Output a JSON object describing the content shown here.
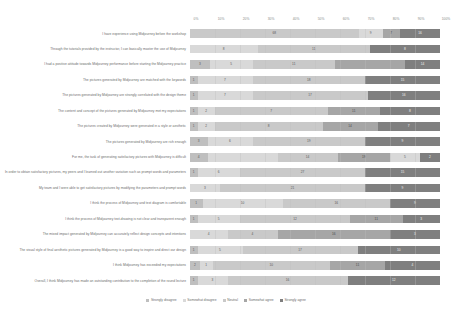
{
  "chart_data": {
    "type": "bar",
    "subtype": "100% stacked horizontal bar (Likert)",
    "title": "",
    "xlabel": "",
    "ylabel": "",
    "xlim": [
      0,
      100
    ],
    "grid": true,
    "legend_position": "bottom",
    "tick_labels": [
      "0%",
      "10%",
      "20%",
      "30%",
      "40%",
      "50%",
      "60%",
      "70%",
      "80%",
      "90%",
      "100%"
    ],
    "series": [
      {
        "name": "Strongly disagree",
        "color": "#bfbfbf"
      },
      {
        "name": "Somewhat disagree",
        "color": "#d9d9d9"
      },
      {
        "name": "Neutral",
        "color": "#c9c9c9"
      },
      {
        "name": "Somewhat agree",
        "color": "#a6a6a6"
      },
      {
        "name": "Strongly agree",
        "color": "#7f7f7f"
      }
    ],
    "categories": [
      "I have experience using Midjourney before the workshop",
      "Through the tutorials provided by the instructor, I can basically master the use of Midjourney",
      "I had a positive attitude towards Midjourney performance before starting the Midjourney practice",
      "The pictures generated by Midjourney are matched with the keywords",
      "The pictures generated by Midjourney are strongly correlated with the design theme",
      "The content and concept of the pictures generated by Midjourney met my expectations",
      "The pictures created by Midjourney were generated in a style or aesthetic",
      "The pictures generated by Midjourney are rich enough",
      "For me, the task of generating satisfactory pictures with Midjourney is difficult",
      "In order to obtain satisfactory pictures, my peers and I learned and arrived variations such as prompt words and parameters",
      "My team and I were able to get satisfactory pictures by modifying the parameters and prompt words",
      "I think the process of Midjourney and text diagram is comfortable",
      "I think the process of Midjourney text-to-drawing is not clear and transparent enough",
      "The mixed impact generated by Midjourney can accurately reflect design concepts and intentions",
      "The visual style of final aesthetic pictures generated by Midjourney is a good way to inspire and direct our design",
      "I think Midjourney has exceeded my expectations",
      "Overall, I think Midjourney has made an outstanding contribution to the completion of the round lecture"
    ],
    "rows": [
      {
        "values": [
          0,
          0,
          68,
          9,
          7,
          16
        ],
        "labels": [
          "",
          "",
          "68",
          "9",
          "7",
          "16"
        ],
        "segments": [
          68,
          9,
          7,
          16
        ]
      },
      {
        "values": [
          0,
          0,
          0,
          0,
          0,
          0
        ],
        "labels": [],
        "segments": []
      }
    ],
    "data": [
      {
        "category_index": 0,
        "segments": [
          {
            "series": "Neutral",
            "value": "68",
            "pct": 68
          },
          {
            "series": "Somewhat agree",
            "value": "9",
            "pct": 9
          },
          {
            "series": "Somewhat agree2",
            "value": "7",
            "pct": 7
          },
          {
            "series": "Strongly agree",
            "value": "16",
            "pct": 16
          }
        ]
      }
    ],
    "stacked_values": [
      [
        0,
        0,
        68,
        9,
        7,
        16
      ],
      [
        0,
        8,
        0,
        56,
        16,
        20
      ],
      [
        3,
        5,
        0,
        44,
        11,
        18
      ],
      [
        1,
        7,
        0,
        54,
        18,
        20
      ],
      [
        1,
        7,
        0,
        52,
        17,
        23
      ],
      [
        1,
        2,
        7,
        49,
        11,
        30
      ],
      [
        1,
        2,
        8,
        44,
        14,
        31
      ],
      [
        3,
        6,
        0,
        56,
        19,
        16
      ],
      [
        4,
        0,
        14,
        30,
        19,
        9
      ],
      [
        1,
        6,
        0,
        48,
        27,
        18
      ],
      [
        0,
        3,
        0,
        59,
        21,
        17
      ],
      [
        1,
        0,
        10,
        54,
        16,
        19
      ],
      [
        1,
        5,
        0,
        42,
        11,
        21
      ],
      [
        0,
        4,
        8,
        50,
        16,
        22
      ],
      [
        1,
        5,
        0,
        52,
        17,
        25
      ],
      [
        2,
        1,
        0,
        40,
        11,
        26
      ],
      [
        1,
        3,
        0,
        48,
        16,
        32
      ]
    ]
  },
  "legend": {
    "items": [
      {
        "label": "Strongly disagree",
        "color": "#bfbfbf"
      },
      {
        "label": "Somewhat disagree",
        "color": "#d9d9d9"
      },
      {
        "label": "Neutral",
        "color": "#c9c9c9"
      },
      {
        "label": "Somewhat agree",
        "color": "#a6a6a6"
      },
      {
        "label": "Strongly agree",
        "color": "#7f7f7f"
      }
    ]
  },
  "rows": [
    {
      "label": "I have experience using Midjourney before the workshop",
      "segments": [
        {
          "series": 2,
          "pct": 67.5,
          "value": "68"
        },
        {
          "series": 1,
          "pct": 9.5,
          "value": "9"
        },
        {
          "series": 3,
          "pct": 7.0,
          "value": "7"
        },
        {
          "series": 4,
          "pct": 16.0,
          "value": "16"
        }
      ]
    },
    {
      "label": "Through the tutorials provided by the instructor, I can basically master the use of Midjourney",
      "segments": [
        {
          "series": 1,
          "pct": 27.0,
          "value": "8"
        },
        {
          "series": 2,
          "pct": 45.0,
          "value": "11"
        },
        {
          "series": 4,
          "pct": 28.0,
          "value": "8"
        }
      ]
    },
    {
      "label": "I had a positive attitude towards Midjourney performance before starting the Midjourney practice",
      "segments": [
        {
          "series": 0,
          "pct": 8.0,
          "value": "3"
        },
        {
          "series": 1,
          "pct": 17.0,
          "value": "5"
        },
        {
          "series": 2,
          "pct": 33.0,
          "value": "11"
        },
        {
          "series": 3,
          "pct": 28.0,
          "value": ""
        },
        {
          "series": 4,
          "pct": 14.0,
          "value": "14"
        }
      ]
    },
    {
      "label": "The pictures generated by Midjourney are matched with the keywords",
      "segments": [
        {
          "series": 0,
          "pct": 3.0,
          "value": "1"
        },
        {
          "series": 1,
          "pct": 22.0,
          "value": "7"
        },
        {
          "series": 2,
          "pct": 45.0,
          "value": "18"
        },
        {
          "series": 4,
          "pct": 30.0,
          "value": "15"
        }
      ]
    },
    {
      "label": "The pictures generated by Midjourney are strongly correlated with the design theme",
      "segments": [
        {
          "series": 0,
          "pct": 3.0,
          "value": "1"
        },
        {
          "series": 1,
          "pct": 22.0,
          "value": "7"
        },
        {
          "series": 2,
          "pct": 46.0,
          "value": "17"
        },
        {
          "series": 4,
          "pct": 29.0,
          "value": "16"
        }
      ]
    },
    {
      "label": "The content and concept of the pictures generated by Midjourney met my expectations",
      "segments": [
        {
          "series": 0,
          "pct": 3.0,
          "value": "1"
        },
        {
          "series": 1,
          "pct": 7.0,
          "value": "2"
        },
        {
          "series": 2,
          "pct": 45.0,
          "value": "7"
        },
        {
          "series": 3,
          "pct": 21.0,
          "value": "11"
        },
        {
          "series": 4,
          "pct": 24.0,
          "value": "8"
        }
      ]
    },
    {
      "label": "The pictures created by Midjourney were generated in a style or aesthetic",
      "segments": [
        {
          "series": 0,
          "pct": 3.0,
          "value": "1"
        },
        {
          "series": 1,
          "pct": 7.0,
          "value": "2"
        },
        {
          "series": 2,
          "pct": 43.0,
          "value": "8"
        },
        {
          "series": 3,
          "pct": 22.0,
          "value": "14"
        },
        {
          "series": 4,
          "pct": 25.0,
          "value": "7"
        }
      ]
    },
    {
      "label": "The pictures generated by Midjourney are rich enough",
      "segments": [
        {
          "series": 0,
          "pct": 7.0,
          "value": "3"
        },
        {
          "series": 1,
          "pct": 18.0,
          "value": "6"
        },
        {
          "series": 2,
          "pct": 45.0,
          "value": "19"
        },
        {
          "series": 4,
          "pct": 30.0,
          "value": "9"
        }
      ]
    },
    {
      "label": "For me, the task of generating satisfactory pictures with Midjourney is difficult",
      "segments": [
        {
          "series": 0,
          "pct": 7.0,
          "value": "4"
        },
        {
          "series": 1,
          "pct": 28.0,
          "value": ""
        },
        {
          "series": 2,
          "pct": 24.0,
          "value": "14"
        },
        {
          "series": 3,
          "pct": 21.0,
          "value": "19"
        },
        {
          "series": 1,
          "pct": 12.0,
          "value": "5"
        },
        {
          "series": 4,
          "pct": 8.0,
          "value": "2"
        }
      ]
    },
    {
      "label": "In order to obtain satisfactory pictures, my peers and I learned out another variation such as prompt words and parameters",
      "segments": [
        {
          "series": 0,
          "pct": 3.0,
          "value": "1"
        },
        {
          "series": 1,
          "pct": 17.0,
          "value": "6"
        },
        {
          "series": 2,
          "pct": 50.0,
          "value": "27"
        },
        {
          "series": 4,
          "pct": 30.0,
          "value": "15"
        }
      ]
    },
    {
      "label": "My team and I were able to get satisfactory pictures by modifying the parameters and prompt words",
      "segments": [
        {
          "series": 1,
          "pct": 12.0,
          "value": "3"
        },
        {
          "series": 2,
          "pct": 58.0,
          "value": "21"
        },
        {
          "series": 4,
          "pct": 30.0,
          "value": "9"
        }
      ]
    },
    {
      "label": "I think the process of Midjourney and text diagram is comfortable",
      "segments": [
        {
          "series": 0,
          "pct": 5.0,
          "value": "1"
        },
        {
          "series": 1,
          "pct": 32.0,
          "value": "10"
        },
        {
          "series": 2,
          "pct": 43.0,
          "value": "16"
        },
        {
          "series": 4,
          "pct": 20.0,
          "value": "9"
        }
      ]
    },
    {
      "label": "I think the process of Midjourney text-drawing is not clear and transparent enough",
      "segments": [
        {
          "series": 0,
          "pct": 3.0,
          "value": "1"
        },
        {
          "series": 1,
          "pct": 17.0,
          "value": "5"
        },
        {
          "series": 2,
          "pct": 44.0,
          "value": "12"
        },
        {
          "series": 3,
          "pct": 21.0,
          "value": "11"
        },
        {
          "series": 4,
          "pct": 15.0,
          "value": "3"
        }
      ]
    },
    {
      "label": "The mixed impact generated by Midjourney can accurately reflect design concepts and intentions",
      "segments": [
        {
          "series": 1,
          "pct": 15.0,
          "value": "4"
        },
        {
          "series": 2,
          "pct": 20.0,
          "value": "4"
        },
        {
          "series": 3,
          "pct": 45.0,
          "value": "16"
        },
        {
          "series": 4,
          "pct": 20.0,
          "value": "3"
        }
      ]
    },
    {
      "label": "The visual style of final aesthetic pictures generated by Midjourney is a good way to inspire and direct our design",
      "segments": [
        {
          "series": 0,
          "pct": 3.0,
          "value": "1"
        },
        {
          "series": 1,
          "pct": 18.0,
          "value": "5"
        },
        {
          "series": 2,
          "pct": 46.0,
          "value": "17"
        },
        {
          "series": 4,
          "pct": 33.0,
          "value": "10"
        }
      ]
    },
    {
      "label": "I think Midjourney has exceeded my expectations",
      "segments": [
        {
          "series": 0,
          "pct": 4.0,
          "value": "2"
        },
        {
          "series": 1,
          "pct": 5.0,
          "value": "1"
        },
        {
          "series": 2,
          "pct": 47.0,
          "value": "10"
        },
        {
          "series": 3,
          "pct": 22.0,
          "value": "11"
        },
        {
          "series": 4,
          "pct": 22.0,
          "value": "4"
        }
      ]
    },
    {
      "label": "Overall, I think Midjourney has made an outstanding contribution to the completion of the round lecture",
      "segments": [
        {
          "series": 0,
          "pct": 3.0,
          "value": "1"
        },
        {
          "series": 1,
          "pct": 12.0,
          "value": "3"
        },
        {
          "series": 2,
          "pct": 48.0,
          "value": "16"
        },
        {
          "series": 4,
          "pct": 37.0,
          "value": "12"
        }
      ]
    }
  ]
}
